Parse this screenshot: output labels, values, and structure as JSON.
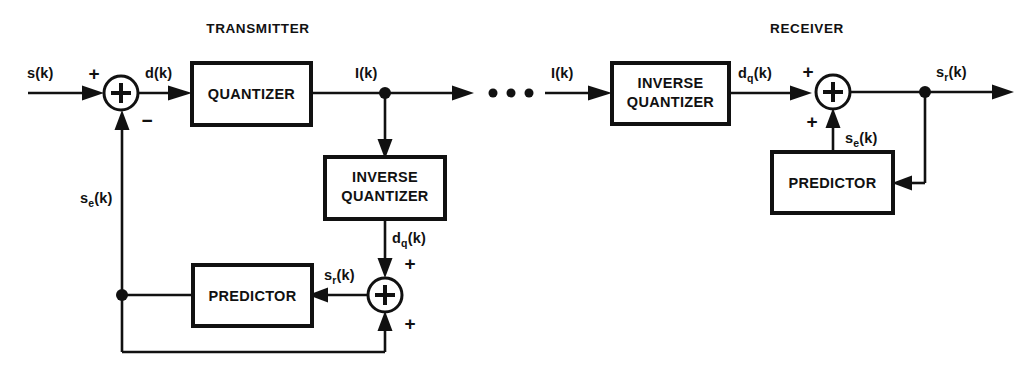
{
  "diagram": {
    "sections": {
      "transmitter": "TRANSMITTER",
      "receiver": "RECEIVER"
    },
    "blocks": {
      "tx_quantizer": "QUANTIZER",
      "tx_inverse_quantizer_line1": "INVERSE",
      "tx_inverse_quantizer_line2": "QUANTIZER",
      "tx_predictor": "PREDICTOR",
      "rx_inverse_quantizer_line1": "INVERSE",
      "rx_inverse_quantizer_line2": "QUANTIZER",
      "rx_predictor": "PREDICTOR"
    },
    "signals": {
      "input_s": "s(k)",
      "difference_d": "d(k)",
      "index_i_tx": "I(k)",
      "index_i_rx": "I(k)",
      "quantized_difference_tx_base": "d",
      "quantized_difference_tx_sub": "q",
      "quantized_difference_tx_tail": "(k)",
      "quantized_difference_rx_base": "d",
      "quantized_difference_rx_sub": "q",
      "quantized_difference_rx_tail": "(k)",
      "estimate_tx_base": "s",
      "estimate_tx_sub": "e",
      "estimate_tx_tail": "(k)",
      "estimate_rx_base": "s",
      "estimate_rx_sub": "e",
      "estimate_rx_tail": "(k)",
      "reconstructed_tx_base": "s",
      "reconstructed_tx_sub": "r",
      "reconstructed_tx_tail": "(k)",
      "reconstructed_rx_base": "s",
      "reconstructed_rx_sub": "r",
      "reconstructed_rx_tail": "(k)"
    },
    "operators": {
      "tx_sum_input_plus": "+",
      "tx_sum_feedback_minus": "−",
      "tx_recon_sum_top_plus": "+",
      "tx_recon_sum_bottom_plus": "+",
      "rx_sum_top_plus": "+",
      "rx_sum_bottom_plus": "+"
    },
    "transmission_gap": "• • •",
    "colors": {
      "ink": "#111111",
      "paper": "#ffffff"
    }
  }
}
